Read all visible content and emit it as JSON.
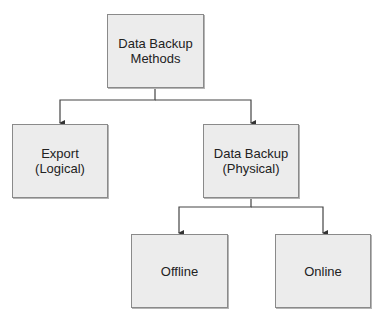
{
  "diagram": {
    "type": "tree",
    "nodes": [
      {
        "id": "root",
        "lines": [
          "Data Backup",
          "Methods"
        ]
      },
      {
        "id": "export",
        "lines": [
          "Export",
          "(Logical)"
        ]
      },
      {
        "id": "physical",
        "lines": [
          "Data Backup",
          "(Physical)"
        ]
      },
      {
        "id": "offline",
        "lines": [
          "Offline"
        ]
      },
      {
        "id": "online",
        "lines": [
          "Online"
        ]
      }
    ],
    "edges": [
      {
        "from": "root",
        "to": "export"
      },
      {
        "from": "root",
        "to": "physical"
      },
      {
        "from": "physical",
        "to": "offline"
      },
      {
        "from": "physical",
        "to": "online"
      }
    ],
    "colors": {
      "box_fill": "#ececec",
      "box_border": "#8a8a8a",
      "line": "#444444",
      "text": "#222222"
    }
  }
}
